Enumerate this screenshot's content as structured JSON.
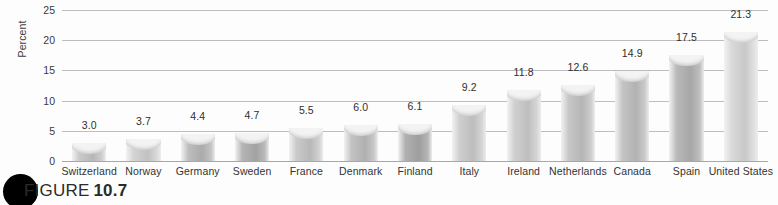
{
  "figure": {
    "caption_prefix": "FIGURE",
    "caption_number": "10.7",
    "bullet_icon": "filled-circle-icon"
  },
  "chart_data": {
    "type": "bar",
    "title": "",
    "xlabel": "",
    "ylabel": "Percent",
    "ylim": [
      0,
      25
    ],
    "yticks": [
      0,
      5,
      10,
      15,
      20,
      25
    ],
    "ytick_labels": [
      "0",
      "5",
      "10",
      "15",
      "20",
      "25"
    ],
    "grid": true,
    "legend": "none",
    "categories": [
      "Switzerland",
      "Norway",
      "Germany",
      "Sweden",
      "France",
      "Denmark",
      "Finland",
      "Italy",
      "Ireland",
      "Netherlands",
      "Canada",
      "Spain",
      "United States"
    ],
    "values": [
      3.0,
      3.7,
      4.4,
      4.7,
      5.5,
      6.0,
      6.1,
      9.2,
      11.8,
      12.6,
      14.9,
      17.5,
      21.3
    ],
    "value_labels": [
      "3.0",
      "3.7",
      "4.4",
      "4.7",
      "5.5",
      "6.0",
      "6.1",
      "9.2",
      "11.8",
      "12.6",
      "14.9",
      "17.5",
      "21.3"
    ],
    "bar_tones": [
      "#c9c9c9",
      "#d3d3d3",
      "#bdbdbd",
      "#b4b4b4",
      "#cacaca",
      "#c2c2c2",
      "#b0b0b0",
      "#cfcfcf",
      "#d0d0d0",
      "#c7c7c7",
      "#c4c4c4",
      "#b9b9b9",
      "#dadada"
    ]
  },
  "colors": {
    "background": "#fdfdfd",
    "gridline": "#bdbdbd",
    "axis": "#a8a8a8",
    "text": "#333333",
    "bullet": "#000000"
  }
}
